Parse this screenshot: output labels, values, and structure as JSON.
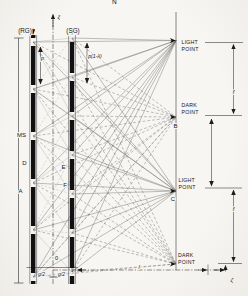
{
  "colors": {
    "ink": "#1c1c1c",
    "ray": "#707070",
    "mesh": "#989898",
    "bar": "#101010"
  },
  "header": {
    "cropped_char": "N"
  },
  "axis": {
    "vertical": "ξ",
    "horizontal": "ζ",
    "origin": "0"
  },
  "gratings": {
    "rg_label": "(RG)",
    "sg_label": "(SG)",
    "pitch_rg": "p",
    "pitch_sg": "p(1-λ)"
  },
  "left": {
    "scale": "MS",
    "slit_d": "D",
    "slit_a": "A"
  },
  "mid": {
    "slit_e": "E",
    "slit_f": "F"
  },
  "screen": {
    "points": [
      {
        "type": "light",
        "label": [
          "LIGHT",
          "POINT"
        ]
      },
      {
        "type": "dark",
        "label": [
          "DARK",
          "POINT"
        ],
        "marker": "B"
      },
      {
        "type": "light",
        "label": [
          "LIGHT",
          "POINT"
        ],
        "marker": "C"
      },
      {
        "type": "dark",
        "label": [
          "DARK",
          "POINT"
        ]
      }
    ]
  },
  "dims": {
    "gap_left": "g/2",
    "gap_right": "g/2",
    "grating_to_screen": "l",
    "fringe_upper": "f",
    "fringe_lower": "f"
  },
  "geometry": {
    "rg": {
      "x": 33.2,
      "top": 35,
      "bottom": 284,
      "slits": [
        42,
        89,
        136,
        183,
        230,
        277
      ],
      "slit_half": 4,
      "bar_w": 4.4,
      "rail_dx": 3.4
    },
    "sg": {
      "x": 72,
      "top": 35,
      "bottom": 284,
      "slits": [
        38,
        77,
        116,
        155,
        194,
        233,
        272
      ],
      "slit_half": 4,
      "bar_w": 4.4,
      "rail_dx": 3.4
    },
    "screen_x": 176,
    "point_ys": [
      40.5,
      117,
      191,
      264
    ],
    "point_types": [
      "light",
      "dark",
      "light",
      "dark"
    ],
    "mesh_max_dy": 80
  }
}
